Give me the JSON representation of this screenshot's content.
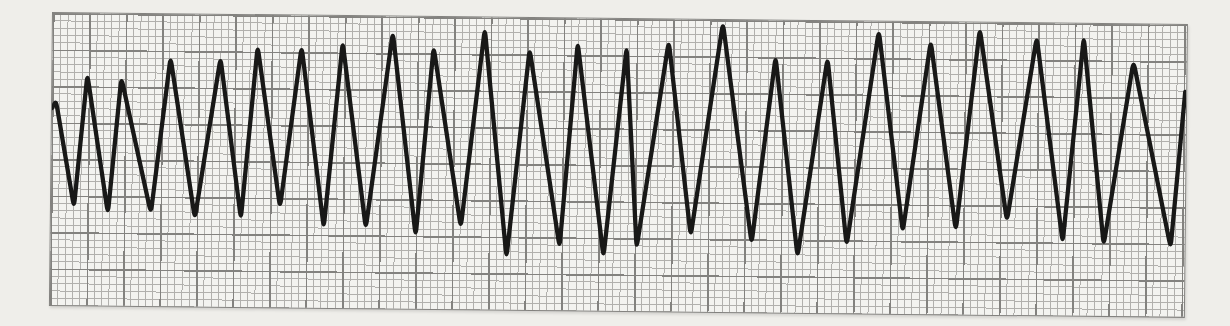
{
  "page": {
    "background_color": "#efeeea"
  },
  "strip": {
    "paper_color": "#f3f3f0",
    "grid": {
      "minor_px": 7.3,
      "major_px": 36.5,
      "minor_color": "#b1b0ad",
      "major_color": "#83827f",
      "minor_squares_per_major": 5
    },
    "trace": {
      "color": "#181817",
      "width_px": 4.3
    }
  },
  "chart_data": {
    "type": "line",
    "title": "",
    "xlabel": "",
    "ylabel": "",
    "grid": true,
    "legend": false,
    "peak_count": 24,
    "x_range_px": [
      0,
      1133
    ],
    "y_range_px": [
      0,
      292
    ],
    "points": [
      [
        0,
        95
      ],
      [
        4,
        88
      ],
      [
        23,
        194
      ],
      [
        35,
        61
      ],
      [
        57,
        200
      ],
      [
        69,
        64
      ],
      [
        100,
        199
      ],
      [
        118,
        43
      ],
      [
        144,
        204
      ],
      [
        168,
        43
      ],
      [
        190,
        204
      ],
      [
        205,
        31
      ],
      [
        229,
        192
      ],
      [
        249,
        31
      ],
      [
        273,
        212
      ],
      [
        290,
        26
      ],
      [
        315,
        212
      ],
      [
        340,
        16
      ],
      [
        365,
        219
      ],
      [
        381,
        30
      ],
      [
        410,
        210
      ],
      [
        432,
        11
      ],
      [
        456,
        240
      ],
      [
        477,
        31
      ],
      [
        509,
        229
      ],
      [
        525,
        24
      ],
      [
        553,
        238
      ],
      [
        574,
        28
      ],
      [
        586,
        229
      ],
      [
        616,
        22
      ],
      [
        640,
        216
      ],
      [
        670,
        3
      ],
      [
        701,
        223
      ],
      [
        723,
        36
      ],
      [
        747,
        236
      ],
      [
        775,
        37
      ],
      [
        796,
        224
      ],
      [
        826,
        9
      ],
      [
        852,
        210
      ],
      [
        878,
        19
      ],
      [
        905,
        208
      ],
      [
        927,
        6
      ],
      [
        956,
        198
      ],
      [
        984,
        14
      ],
      [
        1012,
        219
      ],
      [
        1031,
        13
      ],
      [
        1053,
        221
      ],
      [
        1081,
        37
      ],
      [
        1120,
        223
      ],
      [
        1133,
        67
      ]
    ]
  }
}
